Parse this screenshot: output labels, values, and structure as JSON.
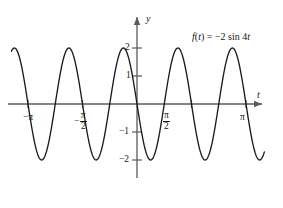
{
  "figure": {
    "background_color": "#ffffff",
    "ink_color": "#161616",
    "axis_color": "#555555",
    "curve_color": "#1b1b1b"
  },
  "axes": {
    "x_axis_label": "t",
    "y_axis_label": "y",
    "x_ticks": [
      {
        "label_kind": "plain",
        "text": "−π",
        "value": -3.14159
      },
      {
        "label_kind": "fraction",
        "sign": "−",
        "numerator": "π",
        "denominator": "2",
        "value": -1.5708
      },
      {
        "label_kind": "fraction",
        "sign": "",
        "numerator": "π",
        "denominator": "2",
        "value": 1.5708
      },
      {
        "label_kind": "plain",
        "text": "π",
        "value": 3.14159
      }
    ],
    "y_ticks": [
      {
        "text": "2",
        "value": 2
      },
      {
        "text": "1",
        "value": 1
      },
      {
        "text": "−1",
        "value": -1
      },
      {
        "text": "−2",
        "value": -2
      }
    ],
    "x_range": [
      -3.95,
      4.25
    ],
    "y_range": [
      -2.6,
      2.6
    ]
  },
  "annotation": {
    "function_label": {
      "f_symbol": "f",
      "open_paren": "(",
      "variable": "t",
      "close_paren": ")",
      "equals": " = ",
      "amplitude": "−2 ",
      "trig": "sin ",
      "frequency": "4",
      "trig_variable": "t",
      "full_text": "f(t) = −2 sin 4t"
    }
  },
  "chart_data": {
    "type": "line",
    "title": "",
    "subtitle": "",
    "xlabel": "t",
    "ylabel": "y",
    "expression": "f(t) = -2 sin 4t",
    "amplitude": -2,
    "angular_frequency": 4,
    "period": 1.5707963,
    "xlim": [
      -3.95,
      4.25
    ],
    "ylim": [
      -2.6,
      2.6
    ],
    "grid": false,
    "legend": "none",
    "annotations": [
      "f(t) = −2 sin 4t"
    ],
    "x_tick_values": [
      -3.14159,
      -1.5708,
      1.5708,
      3.14159
    ],
    "x_tick_labels": [
      "−π",
      "−π/2",
      "π/2",
      "π"
    ],
    "y_tick_values": [
      2,
      1,
      -1,
      -2
    ],
    "y_tick_labels": [
      "2",
      "1",
      "−1",
      "−2"
    ],
    "domain_drawn": [
      -3.62,
      3.67
    ],
    "series": [
      {
        "name": "f(t) = -2 sin 4t",
        "x": [
          -3.62,
          -3.53,
          -3.44,
          -3.34,
          -3.24,
          -3.14,
          -3.04,
          -2.95,
          -2.85,
          -2.75,
          -2.65,
          -2.55,
          -2.45,
          -2.36,
          -2.26,
          -2.16,
          -2.06,
          -1.96,
          -1.86,
          -1.77,
          -1.67,
          -1.57,
          -1.47,
          -1.37,
          -1.27,
          -1.18,
          -1.08,
          -0.98,
          -0.88,
          -0.78,
          -0.69,
          -0.59,
          -0.49,
          -0.39,
          -0.29,
          -0.2,
          -0.1,
          0.0,
          0.1,
          0.2,
          0.29,
          0.39,
          0.49,
          0.59,
          0.69,
          0.78,
          0.88,
          0.98,
          1.08,
          1.18,
          1.27,
          1.37,
          1.47,
          1.57,
          1.67,
          1.77,
          1.86,
          1.96,
          2.06,
          2.16,
          2.26,
          2.36,
          2.45,
          2.55,
          2.65,
          2.75,
          2.85,
          2.95,
          3.04,
          3.14,
          3.24,
          3.34,
          3.44,
          3.53,
          3.62,
          3.67
        ],
        "y": [
          -0.7,
          -1.4,
          -1.87,
          -2.0,
          -1.76,
          -1.21,
          -0.48,
          0.31,
          1.03,
          1.6,
          1.93,
          2.0,
          1.78,
          1.31,
          0.65,
          -0.13,
          -0.88,
          -1.51,
          -1.89,
          -2.0,
          -1.81,
          -1.33,
          -0.66,
          0.12,
          0.87,
          1.5,
          1.89,
          2.0,
          1.81,
          1.34,
          0.67,
          -0.11,
          -0.86,
          -1.49,
          -1.88,
          -2.0,
          -1.82,
          -0.0,
          1.82,
          2.0,
          1.88,
          1.49,
          0.86,
          0.11,
          -0.67,
          -1.34,
          -1.81,
          -2.0,
          -1.89,
          -1.5,
          -0.87,
          -0.12,
          0.66,
          1.33,
          1.81,
          2.0,
          1.89,
          1.51,
          0.88,
          0.13,
          -0.65,
          -1.31,
          -1.78,
          -2.0,
          -1.93,
          -1.6,
          -1.03,
          -0.31,
          0.48,
          1.21,
          1.76,
          2.0,
          1.87,
          1.4,
          0.7,
          0.31
        ]
      }
    ]
  }
}
